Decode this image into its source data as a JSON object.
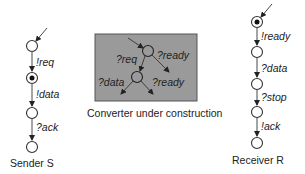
{
  "sender": {
    "caption": "Sender S",
    "states": [
      {
        "id": "s0",
        "active": false
      },
      {
        "id": "s1",
        "active": true
      },
      {
        "id": "s2",
        "active": false
      },
      {
        "id": "s3",
        "active": false
      }
    ],
    "transitions": [
      {
        "from": "s0",
        "to": "s1",
        "label": "!req"
      },
      {
        "from": "s1",
        "to": "s2",
        "label": "!data"
      },
      {
        "from": "s2",
        "to": "s3",
        "label": "?ack"
      }
    ]
  },
  "converter": {
    "caption": "Converter under construction",
    "box_color": "#9a9a9a",
    "transitions": [
      {
        "label": "?req"
      },
      {
        "label": "?ready"
      },
      {
        "label": "?data"
      },
      {
        "label": "?ready"
      }
    ]
  },
  "receiver": {
    "caption": "Receiver R",
    "states": [
      {
        "id": "r0",
        "active": true
      },
      {
        "id": "r1",
        "active": false
      },
      {
        "id": "r2",
        "active": false
      },
      {
        "id": "r3",
        "active": false
      },
      {
        "id": "r4",
        "active": false
      }
    ],
    "transitions": [
      {
        "from": "r0",
        "to": "r1",
        "label": "!ready"
      },
      {
        "from": "r1",
        "to": "r2",
        "label": "?data"
      },
      {
        "from": "r2",
        "to": "r3",
        "label": "?stop"
      },
      {
        "from": "r3",
        "to": "r4",
        "label": "!ack"
      }
    ]
  }
}
